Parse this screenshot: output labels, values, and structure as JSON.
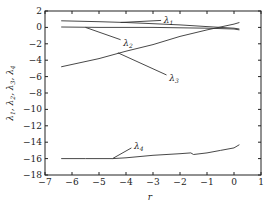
{
  "chart_data": {
    "type": "line",
    "title": "",
    "xlabel": "r",
    "ylabel": "λ1, λ2, λ3, λ4",
    "xlim": [
      -7,
      1
    ],
    "ylim": [
      -18,
      2
    ],
    "xticks": [
      -7,
      -6,
      -5,
      -4,
      -3,
      -2,
      -1,
      0,
      1
    ],
    "yticks": [
      2,
      0,
      -2,
      -4,
      -6,
      -8,
      -10,
      -12,
      -14,
      -16,
      -18
    ],
    "grid": false,
    "legend": "none (inline annotations)",
    "series": [
      {
        "name": "λ1",
        "x": [
          -6.4,
          -5,
          -4,
          -3,
          -2,
          -1,
          0,
          0.2
        ],
        "y": [
          0.8,
          0.7,
          0.6,
          0.45,
          0.3,
          0.1,
          -0.1,
          -0.2
        ]
      },
      {
        "name": "λ2",
        "x": [
          -6.4,
          -5,
          -4,
          -3,
          -2,
          -1,
          0,
          0.2
        ],
        "y": [
          0.05,
          0.0,
          0.0,
          0.0,
          -0.05,
          -0.1,
          -0.2,
          -0.3
        ]
      },
      {
        "name": "λ3",
        "x": [
          -6.4,
          -5,
          -4,
          -3,
          -2,
          -1,
          0,
          0.2
        ],
        "y": [
          -4.8,
          -3.8,
          -2.9,
          -2.1,
          -1.1,
          -0.3,
          0.4,
          0.6
        ]
      },
      {
        "name": "λ4",
        "x": [
          -6.4,
          -5.5,
          -4.5,
          -4,
          -3,
          -2,
          -1.6,
          -1.5,
          -1,
          -0.5,
          0,
          0.2
        ],
        "y": [
          -16.0,
          -16.0,
          -16.0,
          -15.9,
          -15.6,
          -15.4,
          -15.3,
          -15.5,
          -15.3,
          -15.0,
          -14.7,
          -14.3
        ]
      }
    ],
    "annotations": [
      {
        "text": "λ1",
        "x": -2.6,
        "y": 0.9
      },
      {
        "text": "λ2",
        "x": -4.1,
        "y": -1.9
      },
      {
        "text": "λ3",
        "x": -2.4,
        "y": -6.2
      },
      {
        "text": "λ4",
        "x": -3.7,
        "y": -14.5
      }
    ]
  },
  "labels": {
    "x_axis": "r",
    "y_axis_parts": [
      "λ",
      "1",
      ", ",
      "λ",
      "2",
      ", ",
      "λ",
      "3",
      ", ",
      "λ",
      "4"
    ],
    "anno_symbol": "λ",
    "anno_subs": [
      "1",
      "2",
      "3",
      "4"
    ]
  }
}
